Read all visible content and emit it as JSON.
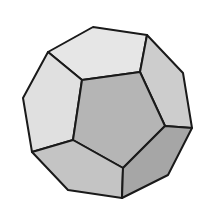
{
  "figure": {
    "background": "#ffffff",
    "stroke_color": "#1a1a1a",
    "faces": [
      {
        "name": "top-face",
        "fill": "#e6e6e6",
        "points": "48,52 93,27 147,35 140,72 82,80"
      },
      {
        "name": "left-face",
        "fill": "#e0e0e0",
        "points": "48,52 82,80 73,140 32,152 23,98"
      },
      {
        "name": "right-upper-face",
        "fill": "#cdcdcd",
        "points": "147,35 183,73 192,128 165,126 140,72"
      },
      {
        "name": "front-face",
        "fill": "#b5b5b5",
        "points": "82,80 140,72 165,126 123,168 73,140"
      },
      {
        "name": "bottom-left-face",
        "fill": "#c4c4c4",
        "points": "32,152 73,140 123,168 122,198 68,190"
      },
      {
        "name": "bottom-right-face",
        "fill": "#a6a6a6",
        "points": "123,168 165,126 192,128 168,175 122,198"
      }
    ]
  }
}
